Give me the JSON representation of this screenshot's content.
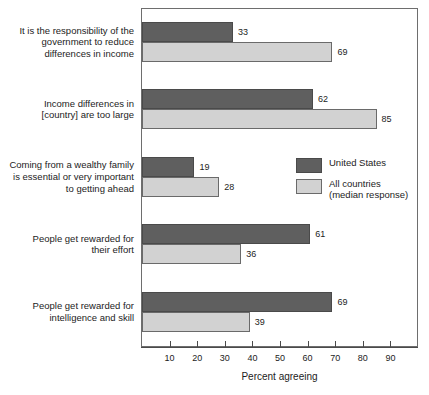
{
  "chart_data": {
    "type": "bar",
    "orientation": "horizontal",
    "title": "",
    "xlabel": "Percent agreeing",
    "ylabel": "",
    "xlim": [
      0,
      100
    ],
    "xticks": [
      10,
      20,
      30,
      40,
      50,
      60,
      70,
      80,
      90
    ],
    "grid": false,
    "legend_position": "right-middle",
    "categories": [
      "It is the responsibility of the\ngovernment to reduce\ndifferences in income",
      "Income differences in\n[country] are too large",
      "Coming from a wealthy family\nis essential or very important\nto getting ahead",
      "People get rewarded for\ntheir effort",
      "People get rewarded for\nintelligence and skill"
    ],
    "series": [
      {
        "name": "United States",
        "color": "#5f5f5f",
        "values": [
          33,
          62,
          19,
          61,
          69
        ]
      },
      {
        "name": "All countries\n(median response)",
        "color": "#d2d2d2",
        "values": [
          69,
          85,
          28,
          36,
          39
        ]
      }
    ]
  },
  "legend": {
    "items": [
      {
        "label": "United States",
        "swatch": "us"
      },
      {
        "label": "All countries\n(median response)",
        "swatch": "all"
      }
    ]
  },
  "axis": {
    "x_title": "Percent agreeing",
    "tick_labels": [
      "10",
      "20",
      "30",
      "40",
      "50",
      "60",
      "70",
      "80",
      "90"
    ]
  },
  "colors": {
    "united_states": "#5f5f5f",
    "all_countries": "#d2d2d2",
    "frame": "#6e6e6e",
    "text": "#1c1c1c",
    "background": "#ffffff"
  }
}
